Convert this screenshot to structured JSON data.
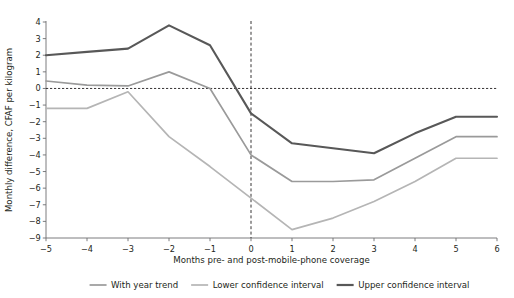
{
  "chart_data": {
    "type": "line",
    "title": "",
    "xlabel": "Months pre- and post-mobile-phone coverage",
    "ylabel": "Monthly difference, CFAF per kilogram",
    "x": [
      -5,
      -4,
      -3,
      -2,
      -1,
      0,
      1,
      2,
      3,
      4,
      5,
      6
    ],
    "xlim": [
      -5,
      6
    ],
    "ylim": [
      -9,
      4
    ],
    "xticks": [
      "-5",
      "-4",
      "-3",
      "-2",
      "-1",
      "0",
      "1",
      "2",
      "3",
      "4",
      "5",
      "6"
    ],
    "yticks": [
      "4",
      "3",
      "2",
      "1",
      "0",
      "-1",
      "-2",
      "-3",
      "-4",
      "-5",
      "-6",
      "-7",
      "-8",
      "-9"
    ],
    "grid": false,
    "legend_position": "bottom",
    "reference_lines": [
      {
        "name": "zero-line",
        "orientation": "horizontal",
        "value": 0,
        "style": "dashed"
      },
      {
        "name": "event-line",
        "orientation": "vertical",
        "value": 0,
        "style": "dashed"
      }
    ],
    "series": [
      {
        "name": "With year trend",
        "color": "#9a9a9a",
        "width": 1.7,
        "values": [
          0.45,
          0.2,
          0.15,
          1.0,
          0.0,
          -4.0,
          -5.6,
          -5.6,
          -5.5,
          -4.2,
          -2.9,
          -2.9
        ]
      },
      {
        "name": "Lower confidence interval",
        "color": "#b5b5b5",
        "width": 1.7,
        "values": [
          -1.2,
          -1.2,
          -0.2,
          -2.9,
          -4.7,
          -6.6,
          -8.5,
          -7.8,
          -6.8,
          -5.6,
          -4.2,
          -4.2
        ]
      },
      {
        "name": "Upper confidence interval",
        "color": "#585858",
        "width": 2.1,
        "values": [
          2.0,
          2.2,
          2.4,
          3.8,
          2.6,
          -1.5,
          -3.3,
          -3.6,
          -3.9,
          -2.7,
          -1.7,
          -1.7
        ]
      }
    ]
  },
  "legend": {
    "items": [
      {
        "label": "With year trend",
        "color": "#9a9a9a"
      },
      {
        "label": "Lower confidence interval",
        "color": "#b5b5b5"
      },
      {
        "label": "Upper confidence interval",
        "color": "#585858"
      }
    ]
  },
  "axes": {
    "x_axis_label": "Months pre- and post-mobile-phone coverage",
    "y_axis_label": "Monthly difference, CFAF per kilogram"
  }
}
